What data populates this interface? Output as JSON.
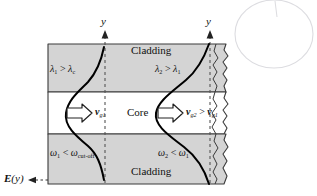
{
  "diagram": {
    "colors": {
      "cladding_fill": "#d4d4d4",
      "core_fill": "#ffffff",
      "outline": "#333333",
      "curve": "#000000",
      "axis_dash": "#555555",
      "annotation_oval": "#d8d8dc"
    }
  },
  "regions": {
    "top_cladding_label": "Cladding",
    "core_label": "Core",
    "bottom_cladding_label": "Cladding"
  },
  "axes": [
    {
      "name": "axis-left",
      "label": "y",
      "x": 105
    },
    {
      "name": "axis-right",
      "label": "y",
      "x": 210
    }
  ],
  "field_label": {
    "text": "E(y)",
    "arrow": "dashed-left-arrow"
  },
  "left_mode": {
    "wavelength_label": "λ₁ > λᴄ",
    "wavelength_main": "λ",
    "velocity_label": "v_g1",
    "velocity_symbol": "v",
    "velocity_sub": "g1",
    "frequency_label": "ω₁ < ωcut-off",
    "arrow_icon": "hollow-right-arrow"
  },
  "right_mode": {
    "wavelength_label": "λ₂ > λ₁",
    "velocity_label": "v_g2 > v_g1",
    "frequency_label": "ω₂ < ω₁",
    "arrow_icon": "hollow-right-arrow"
  },
  "text_parts": {
    "lambda": "λ",
    "omega": "ω",
    "gt": ">",
    "lt": "<",
    "v": "v",
    "sub_1": "1",
    "sub_2": "2",
    "sub_c": "c",
    "sub_g1": "g1",
    "sub_g2": "g2",
    "sub_cutoff": "cut-off",
    "E": "E",
    "y_paren": "(y)"
  },
  "decorations": {
    "right_break": "zigzag-break-line",
    "annotation": "hand-drawn-oval"
  }
}
